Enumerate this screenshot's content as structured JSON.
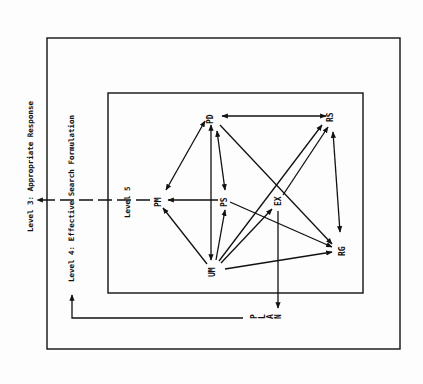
{
  "diagram": {
    "levels": {
      "level3": "Level 3: Appropriate Response",
      "level4": "Level 4: Effective Search Formulation",
      "level5": "Level 5"
    },
    "plan_label": "P L A N",
    "nodes": {
      "PD": "PD",
      "RS": "RS",
      "PM": "PM",
      "PS": "PS",
      "EX": "EX",
      "UM": "UM",
      "RG": "RG"
    },
    "edges": [
      {
        "from": "PD",
        "to": "RS",
        "type": "bidirectional"
      },
      {
        "from": "PD",
        "to": "PM",
        "type": "bidirectional"
      },
      {
        "from": "PD",
        "to": "UM",
        "type": "bidirectional"
      },
      {
        "from": "PD",
        "to": "PS",
        "type": "bidirectional"
      },
      {
        "from": "PD",
        "to": "RG",
        "type": "directed"
      },
      {
        "from": "PS",
        "to": "PM",
        "type": "directed"
      },
      {
        "from": "PS",
        "to": "RG",
        "type": "directed"
      },
      {
        "from": "UM",
        "to": "PM",
        "type": "directed"
      },
      {
        "from": "UM",
        "to": "PS",
        "type": "directed"
      },
      {
        "from": "UM",
        "to": "EX",
        "type": "directed"
      },
      {
        "from": "UM",
        "to": "RS",
        "type": "directed"
      },
      {
        "from": "UM",
        "to": "RG",
        "type": "directed"
      },
      {
        "from": "EX",
        "to": "RS",
        "type": "directed"
      },
      {
        "from": "RS",
        "to": "RG",
        "type": "bidirectional"
      },
      {
        "from": "EX",
        "to": "PLAN",
        "type": "directed"
      },
      {
        "from": "PLAN",
        "to": "Level 4",
        "type": "directed"
      },
      {
        "from": "PM",
        "to": "Level 3",
        "type": "directed"
      }
    ]
  }
}
